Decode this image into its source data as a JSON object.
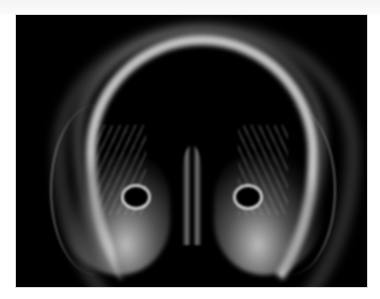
{
  "image": {
    "description": "Grayscale radiographic-style rendering of an arched, jaw-like bony structure on a black background",
    "background_color": "#000000",
    "border_color": "#ffffff",
    "subject_color": "#e6e6e6"
  }
}
